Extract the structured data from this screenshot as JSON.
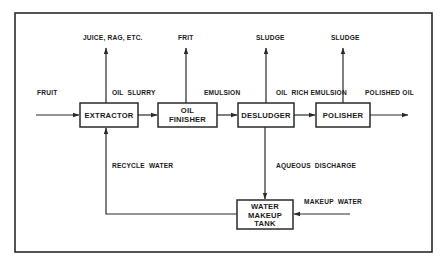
{
  "diagram": {
    "type": "process-flow",
    "colors": {
      "line": "#2a2a2a",
      "text": "#1a1a1a",
      "background": "#ffffff"
    },
    "units": [
      {
        "id": "extractor",
        "label_lines": [
          "EXTRACTOR"
        ]
      },
      {
        "id": "oil_finisher",
        "label_lines": [
          "OIL",
          "FINISHER"
        ]
      },
      {
        "id": "desludger",
        "label_lines": [
          "DESLUDGER"
        ]
      },
      {
        "id": "polisher",
        "label_lines": [
          "POLISHER"
        ]
      },
      {
        "id": "water_makeup_tank",
        "label_lines": [
          "WATER",
          "MAKEUP",
          "TANK"
        ]
      }
    ],
    "streams": {
      "fruit": "FRUIT",
      "oil_slurry": "OIL  SLURRY",
      "emulsion": "EMULSION",
      "oil_rich_emulsion": "OIL  RICH EMULSION",
      "polished_oil": "POLISHED OIL",
      "juice_rag": "JUICE, RAG, ETC.",
      "frit": "FRIT",
      "sludge_desludger": "SLUDGE",
      "sludge_polisher": "SLUDGE",
      "recycle_water": "RECYCLE  WATER",
      "aqueous_discharge": "AQUEOUS  DISCHARGE",
      "makeup_water": "MAKEUP  WATER"
    },
    "edges": [
      {
        "from": "input",
        "to": "extractor",
        "label": "FRUIT"
      },
      {
        "from": "extractor",
        "to": "oil_finisher",
        "label": "OIL  SLURRY"
      },
      {
        "from": "oil_finisher",
        "to": "desludger",
        "label": "EMULSION"
      },
      {
        "from": "desludger",
        "to": "polisher",
        "label": "OIL  RICH EMULSION"
      },
      {
        "from": "polisher",
        "to": "output",
        "label": "POLISHED OIL"
      },
      {
        "from": "extractor",
        "to": "output_top",
        "label": "JUICE, RAG, ETC."
      },
      {
        "from": "oil_finisher",
        "to": "output_top",
        "label": "FRIT"
      },
      {
        "from": "desludger",
        "to": "output_top",
        "label": "SLUDGE"
      },
      {
        "from": "polisher",
        "to": "output_top",
        "label": "SLUDGE"
      },
      {
        "from": "desludger",
        "to": "water_makeup_tank",
        "label": "AQUEOUS  DISCHARGE"
      },
      {
        "from": "input",
        "to": "water_makeup_tank",
        "label": "MAKEUP  WATER"
      },
      {
        "from": "water_makeup_tank",
        "to": "extractor",
        "label": "RECYCLE  WATER"
      }
    ]
  }
}
